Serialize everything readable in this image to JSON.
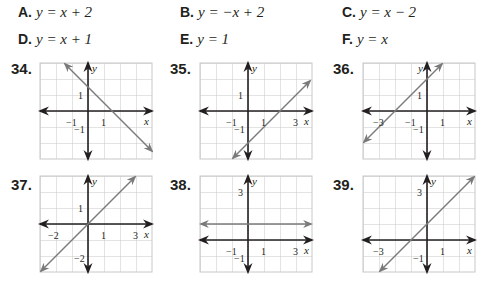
{
  "choices": [
    {
      "letter": "A.",
      "equation": "y = x + 2"
    },
    {
      "letter": "B.",
      "equation": "y = −x + 2"
    },
    {
      "letter": "C.",
      "equation": "y = x − 2"
    },
    {
      "letter": "D.",
      "equation": "y = x + 1"
    },
    {
      "letter": "E.",
      "equation": "y = 1"
    },
    {
      "letter": "F.",
      "equation": "y = x"
    }
  ],
  "problems": [
    {
      "number": "34.",
      "x_labels": [
        "−1",
        "1",
        "x"
      ],
      "y_labels": [
        "y",
        "1",
        "−1"
      ]
    },
    {
      "number": "35.",
      "x_labels": [
        "−1",
        "1",
        "3",
        "x"
      ],
      "y_labels": [
        "y",
        "1",
        "−1"
      ]
    },
    {
      "number": "36.",
      "x_labels": [
        "−3",
        "−1",
        "1",
        "x"
      ],
      "y_labels": [
        "y",
        "1",
        "−1"
      ]
    },
    {
      "number": "37.",
      "x_labels": [
        "−2",
        "1",
        "3",
        "x"
      ],
      "y_labels": [
        "y",
        "1",
        "−2"
      ]
    },
    {
      "number": "38.",
      "x_labels": [
        "−1",
        "1",
        "3",
        "x"
      ],
      "y_labels": [
        "y",
        "3",
        "−1"
      ]
    },
    {
      "number": "39.",
      "x_labels": [
        "−3",
        "1",
        "x"
      ],
      "y_labels": [
        "y",
        "3",
        "−1"
      ]
    }
  ],
  "colors": {
    "grid": "#c8c8c8",
    "axis": "#231f20",
    "line": "#7a7a7a"
  }
}
